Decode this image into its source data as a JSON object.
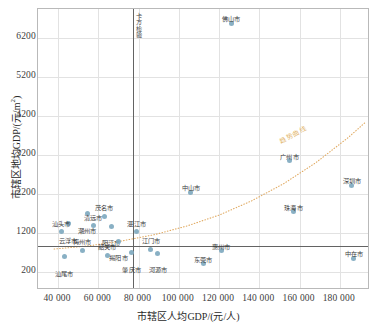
{
  "chart_data": {
    "type": "scatter",
    "title": "",
    "xlabel": "市辖区人均GDP/(元/人)",
    "ylabel": "市辖区地均GDP/(元/m²)",
    "xlim": [
      30000,
      195000
    ],
    "ylim": [
      -250,
      6950
    ],
    "xticks": [
      40000,
      60000,
      80000,
      100000,
      120000,
      140000,
      160000,
      180000
    ],
    "xtick_labels": [
      "40 000",
      "60 000",
      "80 000",
      "100 000",
      "120 000",
      "140 000",
      "160 000",
      "180 000"
    ],
    "yticks": [
      200,
      1200,
      2200,
      3200,
      4200,
      5200,
      6200
    ],
    "ytick_labels": [
      "200",
      "1200",
      "2200",
      "3200",
      "4200",
      "5200",
      "6200"
    ],
    "grid": true,
    "legend_position": "none",
    "marker_color": "#7fa9bf",
    "trend_color": "#e0a960",
    "reference_color": "#636363",
    "annotations": [
      {
        "name": "vertical-reference-line",
        "label": "卡方检验",
        "x": 77000,
        "orientation": "vertical"
      },
      {
        "name": "horizontal-reference-line",
        "label": "",
        "y": 880,
        "orientation": "horizontal"
      },
      {
        "name": "trend-curve-label",
        "label": "趋势曲线",
        "x": 172000,
        "y": 3700
      }
    ],
    "series": [
      {
        "name": "广东省地级市",
        "points": [
          {
            "label": "佛山市",
            "x": 126000,
            "y": 6580
          },
          {
            "label": "广州市",
            "x": 155000,
            "y": 3060
          },
          {
            "label": "深圳市",
            "x": 186000,
            "y": 2430
          },
          {
            "label": "中山市",
            "x": 106000,
            "y": 2260
          },
          {
            "label": "珠海市",
            "x": 157000,
            "y": 1760
          },
          {
            "label": "惠州市",
            "x": 121000,
            "y": 760
          },
          {
            "label": "东莞市",
            "x": 112000,
            "y": 430
          },
          {
            "label": "中在市",
            "x": 187000,
            "y": 560
          },
          {
            "label": "湛江市",
            "x": 79000,
            "y": 1250
          },
          {
            "label": "阳江市",
            "x": 66500,
            "y": 1390
          },
          {
            "label": "茂名市",
            "x": 63000,
            "y": 1640
          },
          {
            "label": "潮州市",
            "x": 54500,
            "y": 1700
          },
          {
            "label": "清远市",
            "x": 57500,
            "y": 1400
          },
          {
            "label": "云浮市",
            "x": 45000,
            "y": 1450
          },
          {
            "label": "汕头市",
            "x": 41500,
            "y": 1240
          },
          {
            "label": "揭阳市",
            "x": 70000,
            "y": 1000
          },
          {
            "label": "梅州市",
            "x": 52000,
            "y": 770
          },
          {
            "label": "汕尾市",
            "x": 43000,
            "y": 600
          },
          {
            "label": "韶关市",
            "x": 64500,
            "y": 640
          },
          {
            "label": "肇庆市",
            "x": 76500,
            "y": 700
          },
          {
            "label": "江门市",
            "x": 86000,
            "y": 790
          },
          {
            "label": "河源市",
            "x": 89500,
            "y": 690
          }
        ]
      }
    ],
    "trend_curve": {
      "name": "趋势曲线",
      "style": "dotted",
      "points": [
        {
          "x": 38000,
          "y": 800
        },
        {
          "x": 55000,
          "y": 880
        },
        {
          "x": 72000,
          "y": 1010
        },
        {
          "x": 88000,
          "y": 1170
        },
        {
          "x": 104000,
          "y": 1390
        },
        {
          "x": 120000,
          "y": 1670
        },
        {
          "x": 136000,
          "y": 2030
        },
        {
          "x": 152000,
          "y": 2470
        },
        {
          "x": 168000,
          "y": 3010
        },
        {
          "x": 184000,
          "y": 3650
        },
        {
          "x": 193000,
          "y": 4060
        }
      ]
    }
  }
}
